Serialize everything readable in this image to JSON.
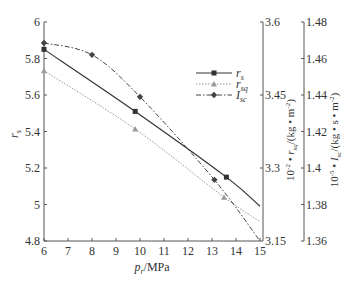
{
  "chart_data": {
    "type": "line",
    "title": "",
    "xlabel": "p_r/MPa",
    "xlabel_parts": {
      "main": "p",
      "sub": "r",
      "unit": "/MPa"
    },
    "xlim": [
      6,
      15
    ],
    "xticks": [
      6,
      7,
      8,
      9,
      10,
      11,
      12,
      13,
      14,
      15
    ],
    "grid": false,
    "legend_position": "upper right (inside)",
    "axes": [
      {
        "id": "left",
        "label": "r_s",
        "range": [
          4.8,
          6
        ],
        "ticks": [
          "4.8",
          "5",
          "5.2",
          "5.4",
          "5.6",
          "5.8",
          "6"
        ]
      },
      {
        "id": "right1",
        "label": "10^-2 • r_sq/(kg • m^-2)",
        "range": [
          3.15,
          3.6
        ],
        "ticks": [
          "3.15",
          "3.3",
          "3.45",
          "3.6"
        ]
      },
      {
        "id": "right2",
        "label": "10^-5 • I_sc/(kg • s • m^-2)",
        "range": [
          1.36,
          1.48
        ],
        "ticks": [
          "1.36",
          "1.38",
          "1.4",
          "1.42",
          "1.44",
          "1.46",
          "1.48"
        ]
      }
    ],
    "series": [
      {
        "name": "r_s",
        "axis": "left",
        "style": "solid",
        "marker": "square",
        "color": "#333333",
        "x": [
          6,
          9.8,
          13.6,
          15
        ],
        "values": [
          5.85,
          5.51,
          5.15,
          4.99
        ]
      },
      {
        "name": "r_sq",
        "axis": "right1",
        "style": "dotted",
        "marker": "triangle",
        "color": "#999999",
        "x": [
          6,
          9.8,
          13.5,
          15
        ],
        "values": [
          3.5,
          3.38,
          3.24,
          3.19
        ]
      },
      {
        "name": "I_sc",
        "axis": "right2",
        "style": "dashdot",
        "marker": "diamond",
        "color": "#444444",
        "x": [
          6,
          8,
          10,
          13.1,
          15
        ],
        "values": [
          1.4685,
          1.462,
          1.439,
          1.3935,
          1.36
        ]
      }
    ]
  },
  "labels": {
    "x_main": "p",
    "x_sub": "r",
    "x_unit": "/MPa",
    "y_left_main": "r",
    "y_left_sub": "s",
    "y_r1_prefix": "10",
    "y_r1_exp": "-2",
    "y_r1_mid": " • r",
    "y_r1_sub": "sq",
    "y_r1_unit": "/(kg • m",
    "y_r1_unit_exp": "-2",
    "y_r1_close": ")",
    "y_r2_prefix": "10",
    "y_r2_exp": "-5",
    "y_r2_mid": " • I",
    "y_r2_sub": "sc",
    "y_r2_unit": "/(kg • s • m",
    "y_r2_unit_exp": "-2",
    "y_r2_close": ")"
  },
  "legend": [
    {
      "main": "r",
      "sub": "s"
    },
    {
      "main": "r",
      "sub": "sq"
    },
    {
      "main": "I",
      "sub": "sc"
    }
  ]
}
